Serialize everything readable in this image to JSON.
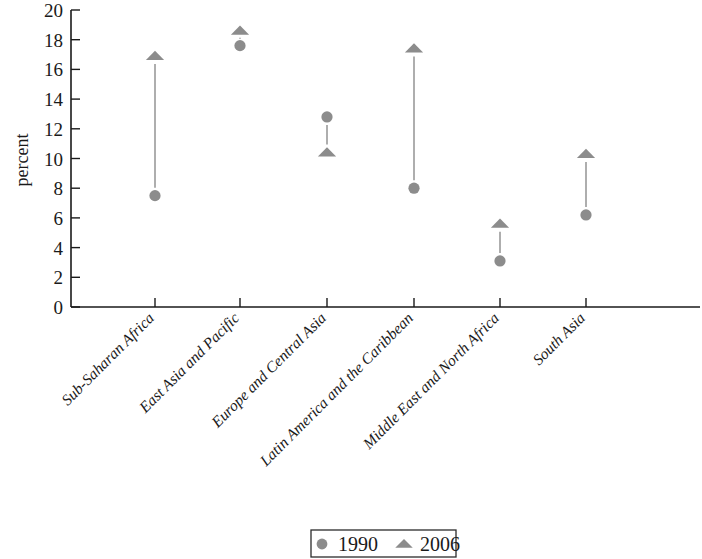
{
  "chart_data": {
    "type": "scatter",
    "title": "",
    "xlabel": "",
    "ylabel": "percent",
    "ylim": [
      0,
      20
    ],
    "yticks": [
      0,
      2,
      4,
      6,
      8,
      10,
      12,
      14,
      16,
      18,
      20
    ],
    "grid": false,
    "legend_position": "bottom",
    "categories": [
      "Sub-Saharan Africa",
      "East Asia and Pacific",
      "Europe and Central Asia",
      "Latin America and the Caribbean",
      "Middle East and North Africa",
      "South Asia"
    ],
    "series": [
      {
        "name": "1990",
        "marker": "circle",
        "color": "#8c8c8c",
        "values": [
          7.5,
          17.6,
          12.8,
          8.0,
          3.1,
          6.2
        ]
      },
      {
        "name": "2006",
        "marker": "triangle",
        "color": "#8c8c8c",
        "values": [
          16.9,
          18.6,
          10.4,
          17.4,
          5.6,
          10.3
        ]
      }
    ]
  },
  "legend": {
    "entries": [
      {
        "label": "1990",
        "marker": "circle"
      },
      {
        "label": "2006",
        "marker": "triangle"
      }
    ]
  },
  "colors": {
    "marker": "#8c8c8c",
    "connector": "#9a9a9a",
    "axis": "#1a1a1a",
    "text": "#1a1a1a",
    "background": "#ffffff"
  }
}
